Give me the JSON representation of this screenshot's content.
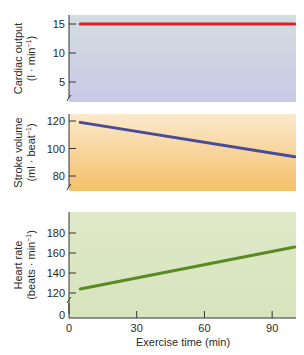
{
  "chart_data": {
    "type": "line",
    "layout": "three stacked panels sharing x-axis",
    "xlabel": "Exercise time (min)",
    "x_ticks": [
      0,
      30,
      60,
      90
    ],
    "xlim": [
      0,
      105
    ],
    "panels": [
      {
        "id": "cardiac-output",
        "ylabel_line1": "Cardiac output",
        "ylabel_line2": "(l · min",
        "ylabel_sup": "−1",
        "ylabel_close": ")",
        "y_ticks": [
          5,
          10,
          15
        ],
        "ylim": [
          2,
          17
        ],
        "axis_break": true,
        "background_top": "#d3dde0",
        "background_bottom": "#c9c9e6",
        "line_color": "#d0262c",
        "series": {
          "name": "Cardiac output",
          "x": [
            5,
            100
          ],
          "y": [
            15,
            15
          ]
        }
      },
      {
        "id": "stroke-volume",
        "ylabel_line1": "Stroke volume",
        "ylabel_line2": "(ml · beat",
        "ylabel_sup": "−1",
        "ylabel_close": ")",
        "y_ticks": [
          80,
          100,
          120
        ],
        "ylim": [
          69,
          125
        ],
        "axis_break": true,
        "background_top": "#fbe9cc",
        "background_bottom": "#f4c06a",
        "line_color": "#4a4a9a",
        "series": {
          "name": "Stroke volume",
          "x": [
            5,
            100
          ],
          "y": [
            119,
            94
          ]
        }
      },
      {
        "id": "heart-rate",
        "ylabel_line1": "Heart rate",
        "ylabel_line2": "(beats · min",
        "ylabel_sup": "−1",
        "ylabel_close": ")",
        "y_ticks": [
          120,
          140,
          160,
          180
        ],
        "zero_tick": "0",
        "ylim": [
          112,
          200
        ],
        "axis_break": true,
        "background_top": "#dfe8c8",
        "background_bottom": "#d7e4bd",
        "line_color": "#5a8a22",
        "series": {
          "name": "Heart rate",
          "x": [
            5,
            100
          ],
          "y": [
            124,
            166
          ]
        }
      }
    ]
  }
}
